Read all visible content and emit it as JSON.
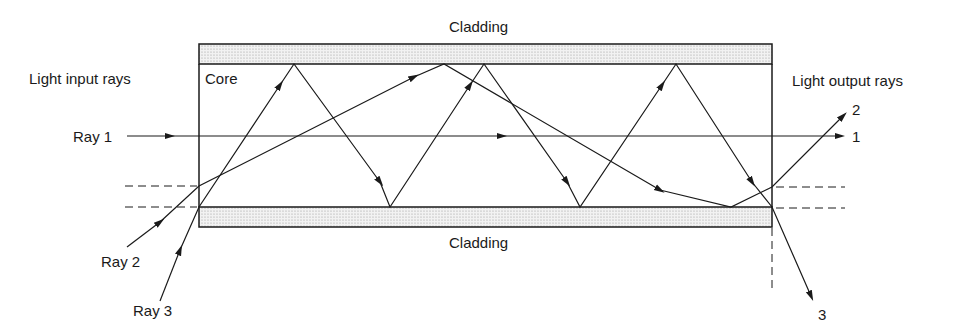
{
  "diagram": {
    "type": "optical-fiber-ray-propagation",
    "labels": {
      "cladding_top": "Cladding",
      "cladding_bottom": "Cladding",
      "core": "Core",
      "input_heading": "Light input rays",
      "output_heading": "Light output rays",
      "ray1": "Ray 1",
      "ray2": "Ray 2",
      "ray3": "Ray 3",
      "out1": "1",
      "out2": "2",
      "out3": "3"
    },
    "colors": {
      "stroke": "#1a1a1a",
      "cladding_fill": "#e6e6e6",
      "background": "#ffffff"
    }
  }
}
